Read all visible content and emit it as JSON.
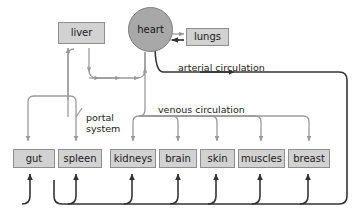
{
  "diagram": {
    "colors": {
      "box_fill": "#d2d2d2",
      "box_stroke": "#8e8e8e",
      "heart_fill": "#a8a8a8",
      "heart_stroke": "#7d7d7d",
      "venous_line": "#9a9a9a",
      "arterial_line": "#333333",
      "background": "#ffffff",
      "text": "#1a1a1a"
    },
    "heart": {
      "label": "heart",
      "x": 128,
      "y": 7,
      "size": 45
    },
    "lungs": {
      "label": "lungs",
      "x": 186,
      "y": 28,
      "width": 43,
      "height": 18
    },
    "liver": {
      "label": "liver",
      "x": 58,
      "y": 22,
      "width": 47,
      "height": 22
    },
    "organs": [
      {
        "label": "gut",
        "x": 13,
        "y": 149,
        "width": 42,
        "height": 19
      },
      {
        "label": "spleen",
        "x": 58,
        "y": 149,
        "width": 44,
        "height": 19
      },
      {
        "label": "kidneys",
        "x": 110,
        "y": 149,
        "width": 46,
        "height": 19
      },
      {
        "label": "brain",
        "x": 159,
        "y": 149,
        "width": 38,
        "height": 19
      },
      {
        "label": "skin",
        "x": 200,
        "y": 149,
        "width": 35,
        "height": 19
      },
      {
        "label": "muscles",
        "x": 238,
        "y": 149,
        "width": 47,
        "height": 19
      },
      {
        "label": "breast",
        "x": 288,
        "y": 149,
        "width": 42,
        "height": 19
      }
    ],
    "flow_labels": [
      {
        "name": "arterial-circulation-label",
        "text": "arterial circulation",
        "x": 178,
        "y": 62
      },
      {
        "name": "venous-circulation-label",
        "text": "venous circulation",
        "x": 158,
        "y": 104
      },
      {
        "name": "portal-system-label",
        "text": "portal\nsystem",
        "x": 86,
        "y": 112
      }
    ]
  }
}
